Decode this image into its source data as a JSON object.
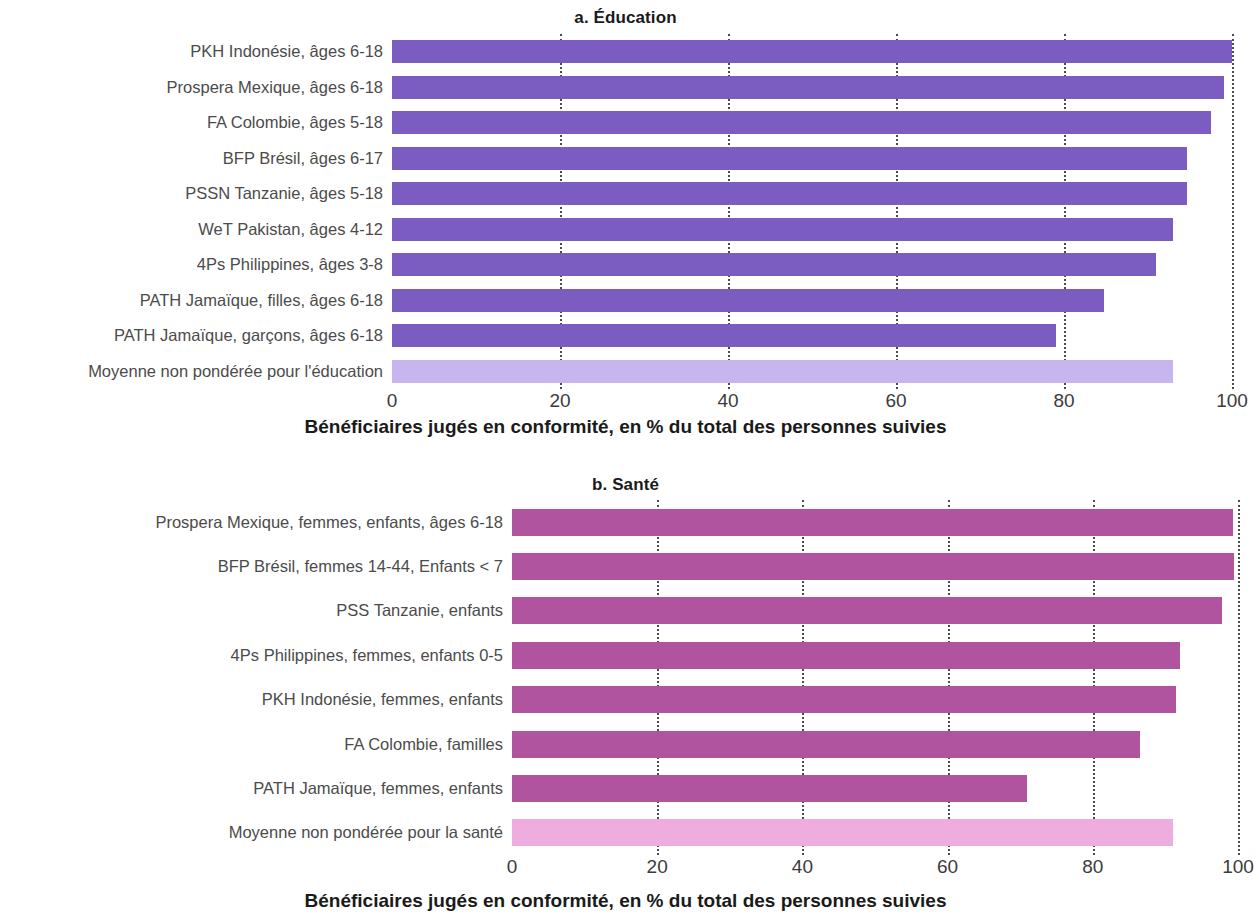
{
  "figure": {
    "panels": [
      {
        "key": "education",
        "title": "a. Éducation",
        "axis_title": "Bénéficiaires jugés en conformité, en % du total des personnes suivies"
      },
      {
        "key": "sante",
        "title": "b. Santé",
        "axis_title": "Bénéficiaires jugés en conformité, en % du total des personnes suivies"
      }
    ]
  },
  "colors": {
    "education_bar": "#7b5cc0",
    "education_average_bar": "#c7b5ef",
    "sante_bar": "#b0549f",
    "sante_average_bar": "#eeadde",
    "gridline": "#4a4a4a",
    "label_text": "#4b4b4b",
    "title_text": "#1a1a1a"
  },
  "chart_data": [
    {
      "type": "bar",
      "orientation": "horizontal",
      "title": "a. Éducation",
      "xlabel": "Bénéficiaires jugés en conformité, en % du total des personnes suivies",
      "ylabel": "",
      "xlim": [
        0,
        100
      ],
      "xticks": [
        0,
        20,
        40,
        60,
        80,
        100
      ],
      "xtick_labels": [
        "0",
        "20",
        "40",
        "60",
        "80",
        "100"
      ],
      "grid": "vertical dotted gridlines at each tick",
      "legend": "none",
      "categories": [
        "PKH Indonésie, âges 6-18",
        "Prospera Mexique, âges 6-18",
        "FA Colombie, âges 5-18",
        "BFP Brésil, âges 6-17",
        "PSSN Tanzanie, âges 5-18",
        "WeT Pakistan, âges 4-12",
        "4Ps Philippines, âges 3-8",
        "PATH Jamaïque, filles, âges 6-18",
        "PATH Jamaïque, garçons, âges 6-18",
        "Moyenne non pondérée pour l'éducation"
      ],
      "values": [
        100,
        99,
        97.5,
        94.6,
        94.6,
        93,
        91,
        84.8,
        79,
        93
      ],
      "highlight_index": 9
    },
    {
      "type": "bar",
      "orientation": "horizontal",
      "title": "b. Santé",
      "xlabel": "Bénéficiaires jugés en conformité, en % du total des personnes suivies",
      "ylabel": "",
      "xlim": [
        0,
        100
      ],
      "xticks": [
        0,
        20,
        40,
        60,
        80,
        100
      ],
      "xtick_labels": [
        "0",
        "20",
        "40",
        "60",
        "80",
        "100"
      ],
      "grid": "vertical dotted gridlines at each tick",
      "legend": "none",
      "categories": [
        "Prospera Mexique, femmes, enfants, âges 6-18",
        "BFP Brésil, femmes 14-44, Enfants < 7",
        "PSS Tanzanie, enfants",
        "4Ps Philippines, femmes, enfants 0-5",
        "PKH Indonésie, femmes, enfants",
        "FA Colombie, familles",
        "PATH Jamaïque, femmes, enfants",
        "Moyenne non pondérée pour la santé"
      ],
      "values": [
        99.3,
        99.5,
        97.8,
        92,
        91.5,
        86.5,
        71,
        91
      ],
      "highlight_index": 7
    }
  ]
}
